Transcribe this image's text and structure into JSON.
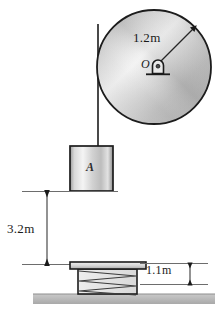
{
  "figure": {
    "labels": {
      "pulley_radius": "1.2m",
      "pulley_center": "O",
      "block_name": "A",
      "drop_height": "3.2m",
      "spring_height": "1.1m"
    },
    "colors": {
      "outline": "#1a1a1a",
      "metal_light": "#f2f2f2",
      "metal_mid": "#bdbdbd",
      "metal_dark": "#8a8a8a",
      "ground": "#b5b5b5",
      "dimension_line": "#3a3a3a",
      "spring_fill": "#e6e6e6"
    },
    "elements": {
      "pulley": "pulley-wheel",
      "bearing": "pin-support-icon",
      "cord": "cord-line",
      "block": "block-a",
      "spring": "coil-spring",
      "spring_plate": "spring-top-plate",
      "ground": "ground-surface",
      "dim_drop": "dimension-3-2m",
      "dim_spring": "dimension-1-1m",
      "dim_radius": "dimension-radius"
    }
  }
}
